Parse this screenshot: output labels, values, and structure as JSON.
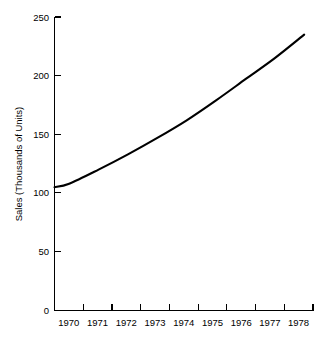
{
  "chart_data": {
    "type": "line",
    "title": "",
    "subtitle": "",
    "xlabel": "",
    "ylabel": "Sales (Thousands of Units)",
    "xlim": [
      1969.5,
      1978.3
    ],
    "ylim": [
      0,
      250
    ],
    "grid": false,
    "legend": "none",
    "line_color": "#000000",
    "axis_color": "#000000",
    "background_color": "#ffffff",
    "x_tick_labels": [
      "1970",
      "1971",
      "1972",
      "1973",
      "1974",
      "1975",
      "1976",
      "1977",
      "1978"
    ],
    "y_tick_labels": [
      "0",
      "50",
      "100",
      "150",
      "200",
      "250"
    ],
    "y_ticks": [
      0,
      50,
      100,
      150,
      200,
      250
    ],
    "categories": [
      1970,
      1971,
      1972,
      1973,
      1974,
      1975,
      1976,
      1977,
      1978
    ],
    "values": [
      108,
      120,
      133,
      147,
      162,
      179,
      197,
      215,
      235
    ],
    "series": [
      {
        "name": "Sales",
        "x": [
          1969.5,
          1970,
          1971,
          1972,
          1973,
          1974,
          1975,
          1976,
          1977,
          1978
        ],
        "values": [
          105,
          108,
          120,
          133,
          147,
          162,
          179,
          197,
          215,
          235
        ]
      }
    ],
    "annotations": []
  },
  "axes": {
    "y_axis_name": "y-axis",
    "x_axis_name": "x-axis"
  }
}
